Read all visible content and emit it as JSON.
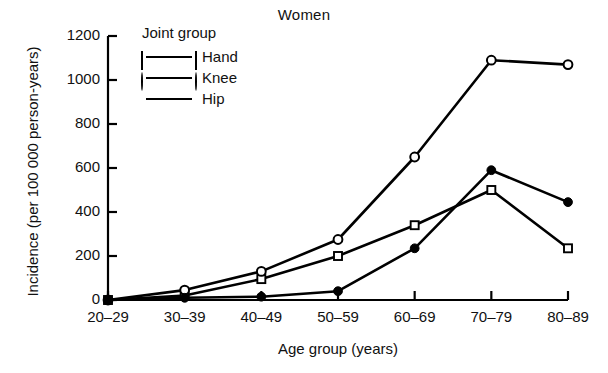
{
  "chart_data": {
    "type": "line",
    "title": "Women",
    "xlabel": "Age group (years)",
    "ylabel": "Incidence (per 100 000 person-years)",
    "categories": [
      "20–29",
      "30–39",
      "40–49",
      "50–59",
      "60–69",
      "70–79",
      "80–89"
    ],
    "series": [
      {
        "name": "Hand",
        "marker": "open-square",
        "values": [
          0,
          20,
          95,
          200,
          340,
          500,
          235
        ]
      },
      {
        "name": "Knee",
        "marker": "open-circle",
        "values": [
          0,
          45,
          130,
          275,
          650,
          1090,
          1070
        ]
      },
      {
        "name": "Hip",
        "marker": "filled-circle",
        "values": [
          0,
          10,
          15,
          40,
          235,
          590,
          445
        ]
      }
    ],
    "ylim": [
      0,
      1200
    ],
    "yticks": [
      0,
      200,
      400,
      600,
      800,
      1000,
      1200
    ],
    "ytick_labels": [
      "0",
      "200",
      "400",
      "600",
      "800",
      "1000",
      "1200"
    ],
    "grid": false,
    "legend_position": "upper-left",
    "legend_title": "Joint group",
    "line_color": "#000000"
  }
}
